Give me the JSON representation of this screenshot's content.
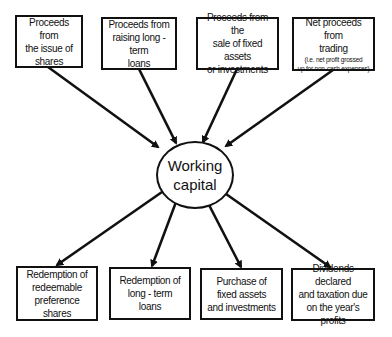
{
  "diagram": {
    "center": {
      "line1": "Working",
      "line2": "capital"
    },
    "sources": [
      {
        "lines": [
          "Proceeds from",
          "the issue of",
          "shares"
        ]
      },
      {
        "lines": [
          "Proceeds from",
          "raising long - term",
          "loans"
        ]
      },
      {
        "lines": [
          "Proceeds from the",
          "sale of fixed assets",
          "or investments"
        ]
      },
      {
        "lines": [
          "Net proceeds from",
          "trading"
        ],
        "note_lines": [
          "(i.e. net profit grossed",
          "up for non-cash expenses)"
        ]
      }
    ],
    "uses": [
      {
        "lines": [
          "Redemption of",
          "redeemable",
          "preference",
          "shares"
        ]
      },
      {
        "lines": [
          "Redemption of",
          "long - term",
          "loans"
        ]
      },
      {
        "lines": [
          "Purchase of",
          "fixed assets",
          "and investments"
        ]
      },
      {
        "lines": [
          "Dividends declared",
          "and taxation due",
          "on the year's profits"
        ]
      }
    ],
    "colors": {
      "stroke": "#111111",
      "background": "#ffffff"
    }
  }
}
